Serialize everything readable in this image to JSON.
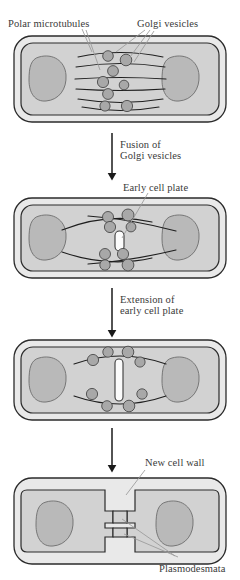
{
  "diagram": {
    "labels": {
      "polar_microtubules": "Polar microtubules",
      "golgi_vesicles": "Golgi vesicles",
      "early_cell_plate": "Early cell plate",
      "new_cell_wall": "New cell wall",
      "plasmodesmata": "Plasmodesmata"
    },
    "transitions": [
      {
        "line1": "Fusion of",
        "line2": "Golgi vesicles"
      },
      {
        "line1": "Extension of",
        "line2": "early cell plate"
      },
      {
        "line1": "",
        "line2": ""
      }
    ],
    "stages": [
      {
        "name": "stage-1-vesicles-along-microtubules",
        "cell_plate": "none",
        "microtubule_arcs": 6,
        "vesicle_count": 8
      },
      {
        "name": "stage-2-early-cell-plate",
        "cell_plate": "short",
        "microtubule_arcs": 4,
        "vesicle_count": 8
      },
      {
        "name": "stage-3-extended-cell-plate",
        "cell_plate": "long",
        "microtubule_arcs": 2,
        "vesicle_count": 8
      },
      {
        "name": "stage-4-two-daughter-cells",
        "cell_plate": "complete",
        "microtubule_arcs": 0,
        "vesicle_count": 0,
        "plasmodesmata_count": 2
      }
    ],
    "colors": {
      "wall_outer": "#e9e9e9",
      "wall_line": "#2b2b2b",
      "cytoplasm": "#d2d2d2",
      "nucleus": "#b9b9b9",
      "vesicle": "#a8a8a8",
      "microtubule": "#1f1f1f",
      "cell_plate": "#fbfbfb",
      "label_text": "#3a3a3a",
      "leader": "#9a9a9a"
    }
  }
}
